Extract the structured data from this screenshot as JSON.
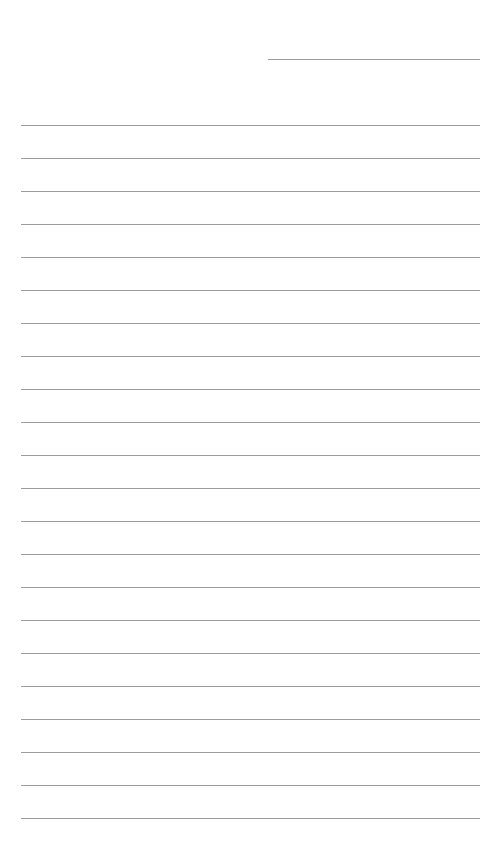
{
  "page": {
    "type": "lined-notepad",
    "header_line": {
      "label": ""
    },
    "rules": {
      "count": 22,
      "first_y": 125,
      "spacing": 33,
      "color": "#9c9c9c"
    },
    "lines": [
      "",
      "",
      "",
      "",
      "",
      "",
      "",
      "",
      "",
      "",
      "",
      "",
      "",
      "",
      "",
      "",
      "",
      "",
      "",
      "",
      "",
      ""
    ]
  }
}
